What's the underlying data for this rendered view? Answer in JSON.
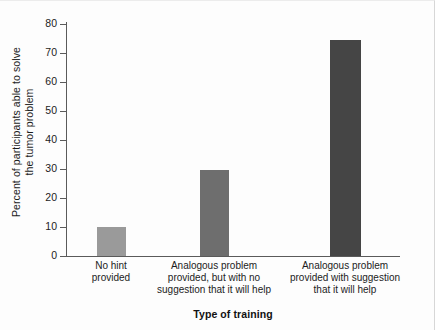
{
  "chart_data": {
    "type": "bar",
    "title": "",
    "xlabel": "Type of training",
    "ylabel_lines": [
      "Percent of participants able to solve",
      "the tumor problem"
    ],
    "ylabel": "Percent of participants able to solve the tumor problem",
    "categories": [
      "No hint provided",
      "Analogous problem provided, but with no suggestion that it will help",
      "Analogous problem provided with suggestion that it will help"
    ],
    "category_lines": [
      [
        "No hint",
        "provided"
      ],
      [
        "Analogous problem",
        "provided, but with no",
        "suggestion that it will help"
      ],
      [
        "Analogous problem",
        "provided with suggestion",
        "that it will help"
      ]
    ],
    "values": [
      10,
      29.5,
      74.5
    ],
    "ylim": [
      0,
      80
    ],
    "yticks": [
      0,
      10,
      20,
      30,
      40,
      50,
      60,
      70,
      80
    ],
    "ytick_labels": [
      "0",
      "10",
      "20",
      "30",
      "40",
      "50",
      "60",
      "70",
      "80"
    ],
    "grid": false,
    "legend": null,
    "bar_colors": [
      "#9a9a9a",
      "#6e6e6e",
      "#454545"
    ]
  },
  "colors": {
    "background": "#fdfdfd",
    "axis": "#5a5a5a",
    "text": "#1c1c1c",
    "page_border": "#d7d7d7"
  }
}
